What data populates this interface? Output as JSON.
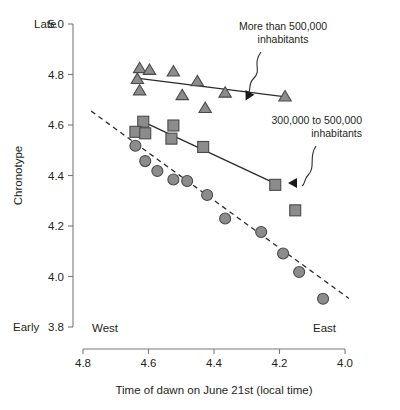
{
  "chart_data": {
    "type": "scatter",
    "title": "",
    "xlabel": "Time of dawn on June 21st (local time)",
    "ylabel": "Chronotype",
    "xlim": [
      4.8,
      4.0
    ],
    "ylim": [
      3.8,
      5.0
    ],
    "x_reversed": true,
    "grid": false,
    "legend_position": "annotations",
    "x_ticks": [
      "4.8",
      "4.6",
      "4.4",
      "4.2",
      "4.0"
    ],
    "x_tick_values": [
      4.8,
      4.6,
      4.4,
      4.2,
      4.0
    ],
    "y_ticks": [
      "5.0",
      "4.8",
      "4.6",
      "4.4",
      "4.2",
      "4.0",
      "3.8"
    ],
    "y_tick_values": [
      5.0,
      4.8,
      4.6,
      4.4,
      4.2,
      4.0,
      3.8
    ],
    "axis_end_labels": {
      "y_top": "Late",
      "y_bottom": "Early",
      "x_left": "West",
      "x_right": "East"
    },
    "annotations": [
      {
        "id": "annot-large-cities",
        "text_line1": "More than 500,000",
        "text_line2": "inhabitants",
        "points_to_series": "More than 500,000 inhabitants"
      },
      {
        "id": "annot-mid-cities",
        "text_line1": "300,000 to 500,000",
        "text_line2": "inhabitants",
        "points_to_series": "300,000 to 500,000 inhabitants"
      }
    ],
    "series": [
      {
        "name": "More than 500,000 inhabitants",
        "marker": "triangle",
        "marker_fill": "#8c8c8c",
        "marker_edge": "#4a4a4a",
        "points": [
          {
            "x": 4.627,
            "y": 4.825
          },
          {
            "x": 4.597,
            "y": 4.818
          },
          {
            "x": 4.524,
            "y": 4.812
          },
          {
            "x": 4.634,
            "y": 4.782
          },
          {
            "x": 4.451,
            "y": 4.773
          },
          {
            "x": 4.627,
            "y": 4.737
          },
          {
            "x": 4.366,
            "y": 4.728
          },
          {
            "x": 4.497,
            "y": 4.718
          },
          {
            "x": 4.183,
            "y": 4.713
          },
          {
            "x": 4.427,
            "y": 4.667
          }
        ],
        "trendline": {
          "style": "solid",
          "x_start": 4.636,
          "y_start": 4.786,
          "x_end": 4.175,
          "y_end": 4.71
        }
      },
      {
        "name": "300,000 to 500,000 inhabitants",
        "marker": "square",
        "marker_fill": "#8c8c8c",
        "marker_edge": "#4a4a4a",
        "points": [
          {
            "x": 4.616,
            "y": 4.613
          },
          {
            "x": 4.64,
            "y": 4.573
          },
          {
            "x": 4.61,
            "y": 4.567
          },
          {
            "x": 4.524,
            "y": 4.598
          },
          {
            "x": 4.53,
            "y": 4.546
          },
          {
            "x": 4.433,
            "y": 4.513
          },
          {
            "x": 4.213,
            "y": 4.363
          },
          {
            "x": 4.152,
            "y": 4.262
          }
        ],
        "trendline": {
          "style": "solid",
          "x_start": 4.622,
          "y_start": 4.616,
          "x_end": 4.196,
          "y_end": 4.358
        }
      },
      {
        "name": "Smaller cities",
        "marker": "circle",
        "marker_fill": "#8c8c8c",
        "marker_edge": "#4a4a4a",
        "points": [
          {
            "x": 4.64,
            "y": 4.518
          },
          {
            "x": 4.61,
            "y": 4.457
          },
          {
            "x": 4.573,
            "y": 4.418
          },
          {
            "x": 4.524,
            "y": 4.384
          },
          {
            "x": 4.482,
            "y": 4.378
          },
          {
            "x": 4.421,
            "y": 4.323
          },
          {
            "x": 4.366,
            "y": 4.23
          },
          {
            "x": 4.256,
            "y": 4.176
          },
          {
            "x": 4.189,
            "y": 4.091
          },
          {
            "x": 4.14,
            "y": 4.018
          },
          {
            "x": 4.067,
            "y": 3.912
          }
        ],
        "trendline": {
          "style": "dashed",
          "x_start": 4.775,
          "y_start": 4.655,
          "x_end": 3.988,
          "y_end": 3.913
        }
      }
    ]
  }
}
